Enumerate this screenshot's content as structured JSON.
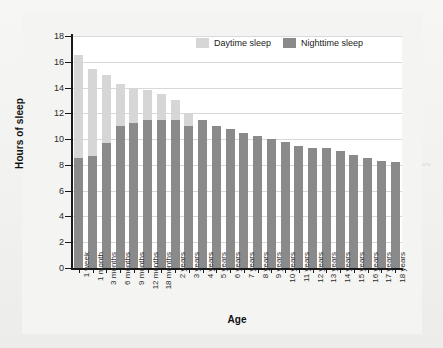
{
  "chart_data": {
    "type": "bar",
    "stacked": true,
    "title": "",
    "xlabel": "Age",
    "ylabel": "Hours of sleep",
    "ylim": [
      0,
      18
    ],
    "yticks": [
      0,
      2,
      4,
      6,
      8,
      10,
      12,
      14,
      16,
      18
    ],
    "grid": true,
    "legend_position": "top-right",
    "categories": [
      "1 week",
      "1 month",
      "3 months",
      "6 months",
      "9 months",
      "12 months",
      "18 months",
      "2 years",
      "3 years",
      "4 years",
      "5 years",
      "6 years",
      "7 years",
      "8 years",
      "9 years",
      "10 years",
      "11 years",
      "12 years",
      "13 years",
      "14 years",
      "15 years",
      "16 years",
      "17 years",
      "18 years"
    ],
    "series": [
      {
        "name": "Nighttime sleep",
        "color": "#8a8a8a",
        "values": [
          8.5,
          8.7,
          9.7,
          11.0,
          11.25,
          11.5,
          11.5,
          11.5,
          11.0,
          11.5,
          11.0,
          10.75,
          10.5,
          10.25,
          10.0,
          9.75,
          9.5,
          9.3,
          9.3,
          9.05,
          8.8,
          8.55,
          8.3,
          8.25
        ]
      },
      {
        "name": "Daytime sleep",
        "color": "#d6d6d6",
        "values": [
          8.0,
          6.75,
          5.3,
          3.25,
          2.75,
          2.3,
          2.0,
          1.5,
          1.0,
          0.0,
          0.0,
          0.0,
          0.0,
          0.0,
          0.0,
          0.0,
          0.0,
          0.0,
          0.0,
          0.0,
          0.0,
          0.0,
          0.0,
          0.0
        ]
      }
    ],
    "totals": [
      16.5,
      15.45,
      15.0,
      14.25,
      14.0,
      13.8,
      13.5,
      13.0,
      12.0,
      11.5,
      11.0,
      10.75,
      10.5,
      10.25,
      10.0,
      9.75,
      9.5,
      9.3,
      9.3,
      9.05,
      8.8,
      8.55,
      8.3,
      8.25
    ]
  },
  "legend": {
    "items": [
      {
        "label": "Daytime sleep",
        "swatch": "day"
      },
      {
        "label": "Nighttime sleep",
        "swatch": "night"
      }
    ]
  },
  "colors": {
    "daytime": "#d6d6d6",
    "nighttime": "#8a8a8a",
    "axis": "#1a1a1a",
    "grid": "#d8d8d8",
    "plot_background": "#ffffff",
    "page_background": "#f2f2f0"
  }
}
